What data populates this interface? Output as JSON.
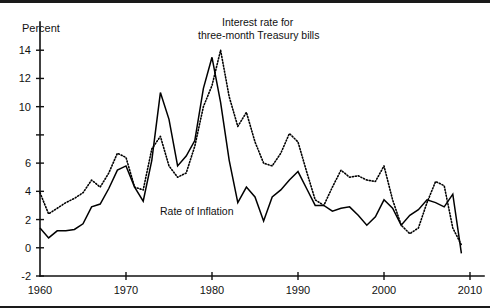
{
  "figure": {
    "y_axis_title": "Percent",
    "annotations": {
      "interest_line1": "Interest rate for",
      "interest_line2": "three-month Treasury bills",
      "inflation": "Rate of Inflation"
    }
  },
  "chart_data": {
    "type": "line",
    "title": "",
    "subtitle": "",
    "xlabel": "",
    "ylabel": "Percent",
    "xlim": [
      1960,
      2010
    ],
    "ylim": [
      -2,
      16
    ],
    "xticks": [
      1960,
      1970,
      1980,
      1990,
      2000,
      2010
    ],
    "xtick_labels": [
      "1960",
      "1970",
      "1980",
      "1990",
      "2000",
      "2010"
    ],
    "yticks": [
      -2,
      0,
      2,
      4,
      6,
      8,
      10,
      12,
      14
    ],
    "ytick_labels": [
      "-2",
      "0",
      "2",
      "4",
      "6",
      "",
      "10",
      "12",
      "14"
    ],
    "grid": false,
    "legend": "annotations-inline",
    "x": [
      1960,
      1961,
      1962,
      1963,
      1964,
      1965,
      1966,
      1967,
      1968,
      1969,
      1970,
      1971,
      1972,
      1973,
      1974,
      1975,
      1976,
      1977,
      1978,
      1979,
      1980,
      1981,
      1982,
      1983,
      1984,
      1985,
      1986,
      1987,
      1988,
      1989,
      1990,
      1991,
      1992,
      1993,
      1994,
      1995,
      1996,
      1997,
      1998,
      1999,
      2000,
      2001,
      2002,
      2003,
      2004,
      2005,
      2006,
      2007,
      2008,
      2009
    ],
    "series": [
      {
        "name": "Rate of Inflation",
        "style": "solid",
        "values": [
          1.4,
          0.7,
          1.2,
          1.2,
          1.3,
          1.7,
          2.9,
          3.1,
          4.2,
          5.5,
          5.8,
          4.3,
          3.3,
          6.2,
          11.0,
          9.1,
          5.8,
          6.5,
          7.6,
          11.3,
          13.5,
          10.3,
          6.2,
          3.2,
          4.3,
          3.6,
          1.9,
          3.6,
          4.1,
          4.8,
          5.4,
          4.2,
          3.0,
          3.0,
          2.6,
          2.8,
          2.9,
          2.3,
          1.6,
          2.2,
          3.4,
          2.8,
          1.6,
          2.3,
          2.7,
          3.4,
          3.2,
          2.9,
          3.8,
          -0.4
        ]
      },
      {
        "name": "Interest rate for three-month Treasury bills",
        "style": "dotted",
        "values": [
          3.9,
          2.4,
          2.8,
          3.2,
          3.5,
          3.9,
          4.8,
          4.3,
          5.3,
          6.7,
          6.4,
          4.3,
          4.1,
          7.0,
          7.9,
          5.8,
          5.0,
          5.3,
          7.2,
          10.0,
          11.5,
          14.0,
          10.7,
          8.6,
          9.6,
          7.5,
          6.0,
          5.8,
          6.7,
          8.1,
          7.5,
          5.4,
          3.4,
          3.0,
          4.3,
          5.5,
          5.0,
          5.1,
          4.8,
          4.7,
          5.8,
          3.4,
          1.6,
          1.0,
          1.4,
          3.2,
          4.7,
          4.4,
          1.4,
          0.2
        ]
      }
    ]
  },
  "geometry": {
    "plot_left": 40,
    "plot_right": 470,
    "plot_top": 22,
    "plot_bottom": 276,
    "x_min": 1960,
    "x_max": 2010,
    "y_min": -2,
    "y_max": 16
  }
}
